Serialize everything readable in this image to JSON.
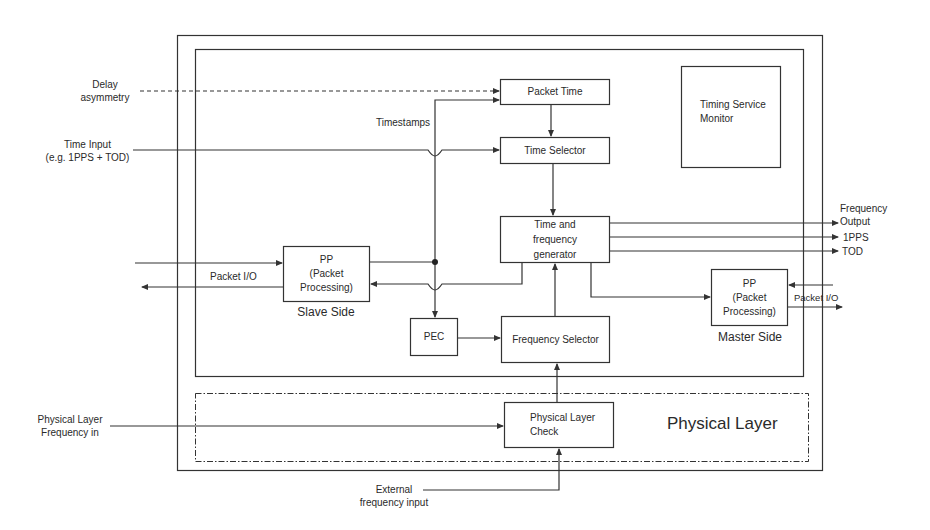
{
  "diagram": {
    "type": "block-diagram",
    "regions": {
      "physical_layer": "Physical Layer"
    },
    "blocks": {
      "packet_time": "Packet Time",
      "time_selector": "Time Selector",
      "timing_service_monitor": "Timing Service Monitor",
      "time_freq_gen": "Time and frequency generator",
      "pp_slave": {
        "line1": "PP",
        "line2": "(Packet",
        "line3": "Processing)"
      },
      "pp_master": {
        "line1": "PP",
        "line2": "(Packet",
        "line3": "Processing)"
      },
      "pec": "PEC",
      "frequency_selector": "Frequency Selector",
      "physical_layer_check": {
        "line1": "Physical Layer",
        "line2": "Check"
      }
    },
    "captions": {
      "slave_side": "Slave Side",
      "master_side": "Master Side",
      "timestamps": "Timestamps"
    },
    "inputs": {
      "delay_asymmetry": {
        "line1": "Delay",
        "line2": "asymmetry"
      },
      "time_input": {
        "line1": "Time Input",
        "line2": "(e.g. 1PPS + TOD)"
      },
      "packet_io_slave": "Packet I/O",
      "physical_layer_freq": {
        "line1": "Physical Layer",
        "line2": "Frequency in"
      },
      "external_freq": {
        "line1": "External",
        "line2": "frequency input"
      }
    },
    "outputs": {
      "frequency_output": {
        "line1": "Frequency",
        "line2": "Output"
      },
      "pps": "1PPS",
      "tod": "TOD",
      "packet_io_master": "Packet I/O"
    },
    "colors": {
      "line": "#333333",
      "background": "#ffffff",
      "text": "#2a2a2a"
    }
  }
}
